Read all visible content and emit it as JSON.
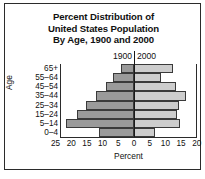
{
  "figure": {
    "title_lines": [
      "Percent Distribution of",
      "United States Population",
      "By Age, 1900 and 2000"
    ]
  },
  "legend": {
    "left_series": "1900",
    "right_series": "2000"
  },
  "axes": {
    "y_axis_title": "Age",
    "x_axis_title": "Percent",
    "x_tick_labels": [
      "25",
      "20",
      "15",
      "10",
      "5",
      "0",
      "5",
      "10",
      "15",
      "20"
    ]
  },
  "colors": {
    "series_1900": "#9a9a9a",
    "series_2000": "#cdcdcd",
    "axis": "#2b2b2b",
    "text": "#111111",
    "background": "#ffffff"
  },
  "chart_data": {
    "type": "bar",
    "subtype": "population-pyramid",
    "title": "Percent Distribution of United States Population By Age, 1900 and 2000",
    "xlabel": "Percent",
    "ylabel": "Age",
    "orientation": "horizontal",
    "grid": false,
    "legend_position": "top-center",
    "categories": [
      "65+",
      "55–64",
      "45–54",
      "35–44",
      "25–34",
      "15–24",
      "5–14",
      "0–4"
    ],
    "x_ticks_left": [
      25,
      20,
      15,
      10,
      5,
      0
    ],
    "x_ticks_right": [
      0,
      5,
      10,
      15,
      20
    ],
    "xlim_left": [
      0,
      25
    ],
    "xlim_right": [
      0,
      20
    ],
    "series": [
      {
        "name": "1900",
        "side": "left",
        "color": "#9a9a9a",
        "values": [
          4.1,
          6.8,
          9.0,
          12.1,
          15.3,
          18.1,
          21.5,
          11.3
        ]
      },
      {
        "name": "2000",
        "side": "right",
        "color": "#cdcdcd",
        "values": [
          12.4,
          8.6,
          13.4,
          16.6,
          14.2,
          13.6,
          14.5,
          6.8
        ]
      }
    ]
  }
}
